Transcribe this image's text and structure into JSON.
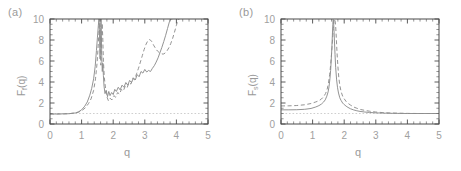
{
  "figure": {
    "background_color": "#ffffff",
    "axis_color": "#4a4a4a",
    "curve_color": "#8d8d8d",
    "refline_color": "#c9c9c9",
    "tick_text_color": "#9fa0a0"
  },
  "panels": [
    {
      "label": "(a)",
      "ylabel_main": "F",
      "ylabel_sub": "f",
      "ylabel_tail": "(q)",
      "xlabel": "q"
    },
    {
      "label": "(b)",
      "ylabel_main": "F",
      "ylabel_sub": "s",
      "ylabel_tail": "(q)",
      "xlabel": "q"
    }
  ],
  "chart_data": [
    {
      "type": "line",
      "title": "(a)",
      "xlabel": "q",
      "ylabel": "F_f(q)",
      "xlim": [
        0,
        5
      ],
      "ylim": [
        0,
        10
      ],
      "xticks": [
        0,
        1,
        2,
        3,
        4,
        5
      ],
      "yticks": [
        0,
        2,
        4,
        6,
        8,
        10
      ],
      "grid": false,
      "legend": "none",
      "annotations": [
        {
          "text": "horizontal dotted reference line at y = 1",
          "y": 1
        }
      ],
      "reference_lines": [
        {
          "orientation": "horizontal",
          "y": 1,
          "style": "dotted"
        }
      ],
      "series": [
        {
          "name": "solid",
          "style": "solid",
          "x": [
            0.0,
            0.2,
            0.4,
            0.6,
            0.8,
            0.9,
            1.0,
            1.1,
            1.18,
            1.26,
            1.32,
            1.38,
            1.43,
            1.47,
            1.5,
            1.53,
            1.55,
            1.565,
            1.575,
            1.585,
            1.595,
            1.605,
            1.615,
            1.625,
            1.64,
            1.655,
            1.67,
            1.69,
            1.71,
            1.74,
            1.78,
            1.82,
            1.86,
            1.9,
            1.95,
            2.0,
            2.05,
            2.1,
            2.16,
            2.22,
            2.28,
            2.34,
            2.4,
            2.46,
            2.52,
            2.58,
            2.64,
            2.7,
            2.76,
            2.82,
            2.88,
            2.94,
            3.0,
            3.06,
            3.12,
            3.18,
            3.24,
            3.3,
            3.36,
            3.42,
            3.48,
            3.54,
            3.6,
            3.66,
            3.72,
            3.78,
            3.82,
            3.86
          ],
          "y": [
            0.95,
            0.95,
            0.96,
            0.98,
            1.05,
            1.15,
            1.35,
            1.7,
            2.1,
            2.75,
            3.4,
            4.3,
            5.5,
            7.0,
            8.2,
            9.4,
            10.0,
            9.0,
            7.2,
            6.2,
            7.5,
            9.2,
            10.0,
            8.6,
            6.2,
            5.0,
            5.8,
            4.6,
            3.6,
            2.9,
            3.2,
            2.6,
            3.1,
            2.7,
            3.0,
            2.8,
            3.3,
            3.1,
            3.5,
            3.25,
            3.7,
            3.5,
            3.95,
            3.7,
            4.15,
            3.95,
            4.4,
            4.2,
            4.7,
            4.5,
            5.0,
            4.85,
            5.2,
            4.95,
            5.1,
            5.0,
            5.3,
            5.55,
            5.9,
            6.3,
            6.8,
            7.3,
            7.85,
            8.45,
            9.1,
            9.75,
            10.0,
            10.0
          ]
        },
        {
          "name": "dashed",
          "style": "dashed",
          "x": [
            0.0,
            0.3,
            0.6,
            0.85,
            1.0,
            1.12,
            1.22,
            1.3,
            1.38,
            1.44,
            1.49,
            1.52,
            1.545,
            1.56,
            1.572,
            1.584,
            1.596,
            1.608,
            1.62,
            1.635,
            1.65,
            1.67,
            1.69,
            1.72,
            1.76,
            1.8,
            1.85,
            1.9,
            1.96,
            2.02,
            2.08,
            2.14,
            2.2,
            2.26,
            2.32,
            2.38,
            2.44,
            2.5,
            2.56,
            2.62,
            2.68,
            2.74,
            2.8,
            2.86,
            2.92,
            2.98,
            3.04,
            3.1,
            3.16,
            3.22,
            3.28,
            3.34,
            3.4,
            3.46,
            3.52,
            3.58,
            3.64,
            3.7,
            3.76,
            3.82,
            3.88,
            3.94,
            4.0,
            4.06,
            4.1
          ],
          "y": [
            0.95,
            0.96,
            0.98,
            1.08,
            1.25,
            1.55,
            1.95,
            2.4,
            3.2,
            4.3,
            5.8,
            7.2,
            8.6,
            9.6,
            10.0,
            8.8,
            6.8,
            5.6,
            6.6,
            8.4,
            9.6,
            8.2,
            6.0,
            4.4,
            3.3,
            2.6,
            2.2,
            2.45,
            2.3,
            2.7,
            2.55,
            3.0,
            2.85,
            3.3,
            3.15,
            3.6,
            3.45,
            3.95,
            3.8,
            4.35,
            4.2,
            4.8,
            5.3,
            5.9,
            6.5,
            7.1,
            7.6,
            7.95,
            8.05,
            7.85,
            7.5,
            7.2,
            6.95,
            6.8,
            6.7,
            6.65,
            6.75,
            6.95,
            7.25,
            7.65,
            8.15,
            8.75,
            9.4,
            10.0,
            10.0
          ]
        }
      ]
    },
    {
      "type": "line",
      "title": "(b)",
      "xlabel": "q",
      "ylabel": "F_s(q)",
      "xlim": [
        0,
        5
      ],
      "ylim": [
        0,
        10
      ],
      "xticks": [
        0,
        1,
        2,
        3,
        4,
        5
      ],
      "yticks": [
        0,
        2,
        4,
        6,
        8,
        10
      ],
      "grid": false,
      "legend": "none",
      "annotations": [
        {
          "text": "horizontal dotted reference line at y = 1",
          "y": 1
        }
      ],
      "reference_lines": [
        {
          "orientation": "horizontal",
          "y": 1,
          "style": "dotted"
        }
      ],
      "series": [
        {
          "name": "solid",
          "style": "solid",
          "x": [
            0.0,
            0.25,
            0.5,
            0.75,
            0.95,
            1.1,
            1.2,
            1.28,
            1.35,
            1.4,
            1.45,
            1.49,
            1.52,
            1.55,
            1.57,
            1.59,
            1.61,
            1.625,
            1.64,
            1.65,
            1.66,
            1.675,
            1.69,
            1.71,
            1.73,
            1.76,
            1.79,
            1.82,
            1.86,
            1.9,
            1.95,
            2.0,
            2.06,
            2.12,
            2.2,
            2.3,
            2.4,
            2.5,
            2.65,
            2.8,
            3.0,
            3.2,
            3.45,
            3.7,
            4.0,
            4.3,
            4.6,
            5.0
          ],
          "y": [
            1.35,
            1.35,
            1.36,
            1.4,
            1.48,
            1.62,
            1.75,
            1.9,
            2.1,
            2.3,
            2.65,
            3.05,
            3.55,
            4.35,
            5.1,
            6.1,
            7.3,
            8.4,
            9.5,
            9.95,
            9.9,
            9.1,
            8.0,
            6.6,
            5.4,
            4.2,
            3.45,
            2.95,
            2.5,
            2.25,
            2.0,
            1.85,
            1.7,
            1.58,
            1.45,
            1.34,
            1.26,
            1.2,
            1.14,
            1.1,
            1.06,
            1.04,
            1.02,
            1.01,
            1.0,
            1.0,
            1.0,
            1.0
          ]
        },
        {
          "name": "dashed",
          "style": "dashed",
          "x": [
            0.0,
            0.25,
            0.5,
            0.75,
            0.95,
            1.1,
            1.2,
            1.28,
            1.35,
            1.41,
            1.46,
            1.5,
            1.54,
            1.57,
            1.6,
            1.63,
            1.655,
            1.675,
            1.695,
            1.71,
            1.725,
            1.74,
            1.755,
            1.775,
            1.8,
            1.83,
            1.86,
            1.9,
            1.95,
            2.0,
            2.06,
            2.13,
            2.2,
            2.3,
            2.4,
            2.52,
            2.65,
            2.8,
            3.0,
            3.2,
            3.45,
            3.7,
            4.0,
            4.3,
            4.6,
            5.0
          ],
          "y": [
            1.72,
            1.73,
            1.76,
            1.83,
            1.95,
            2.1,
            2.22,
            2.38,
            2.6,
            2.9,
            3.3,
            3.85,
            4.7,
            5.6,
            6.7,
            8.0,
            9.1,
            9.75,
            10.0,
            9.9,
            9.5,
            8.8,
            7.9,
            6.7,
            5.5,
            4.4,
            3.7,
            3.1,
            2.65,
            2.4,
            2.15,
            1.95,
            1.8,
            1.62,
            1.5,
            1.38,
            1.3,
            1.22,
            1.14,
            1.09,
            1.05,
            1.03,
            1.01,
            1.0,
            1.0,
            1.0
          ]
        }
      ]
    }
  ]
}
